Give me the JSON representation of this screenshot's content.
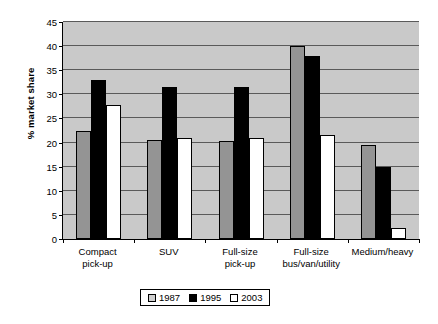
{
  "chart_data": {
    "type": "bar",
    "title": "",
    "xlabel": "",
    "ylabel": "% market share",
    "ylim": [
      0,
      45
    ],
    "yticks": [
      0,
      5,
      10,
      15,
      20,
      25,
      30,
      35,
      40,
      45
    ],
    "grid": true,
    "legend_position": "bottom-center",
    "categories": [
      "Compact pick-up",
      "SUV",
      "Full-size pick-up",
      "Full-size bus/van/utility",
      "Medium/heavy"
    ],
    "category_lines": [
      [
        "Compact",
        "pick-up"
      ],
      [
        "SUV",
        ""
      ],
      [
        "Full-size",
        "pick-up"
      ],
      [
        "Full-size",
        "bus/van/utility"
      ],
      [
        "Medium/heavy",
        ""
      ]
    ],
    "series": [
      {
        "name": "1987",
        "color": "#949494",
        "values": [
          22.5,
          20.5,
          20.3,
          40.0,
          19.5
        ]
      },
      {
        "name": "1995",
        "color": "#000000",
        "values": [
          33.0,
          31.5,
          31.5,
          38.0,
          15.0
        ]
      },
      {
        "name": "2003",
        "color": "#ffffff",
        "values": [
          27.8,
          21.0,
          21.0,
          21.5,
          2.3
        ]
      }
    ]
  },
  "plot_area": {
    "background_color": "#c9c9c9",
    "gridline_color": "#5a5a5a",
    "axis_color": "#000000"
  }
}
